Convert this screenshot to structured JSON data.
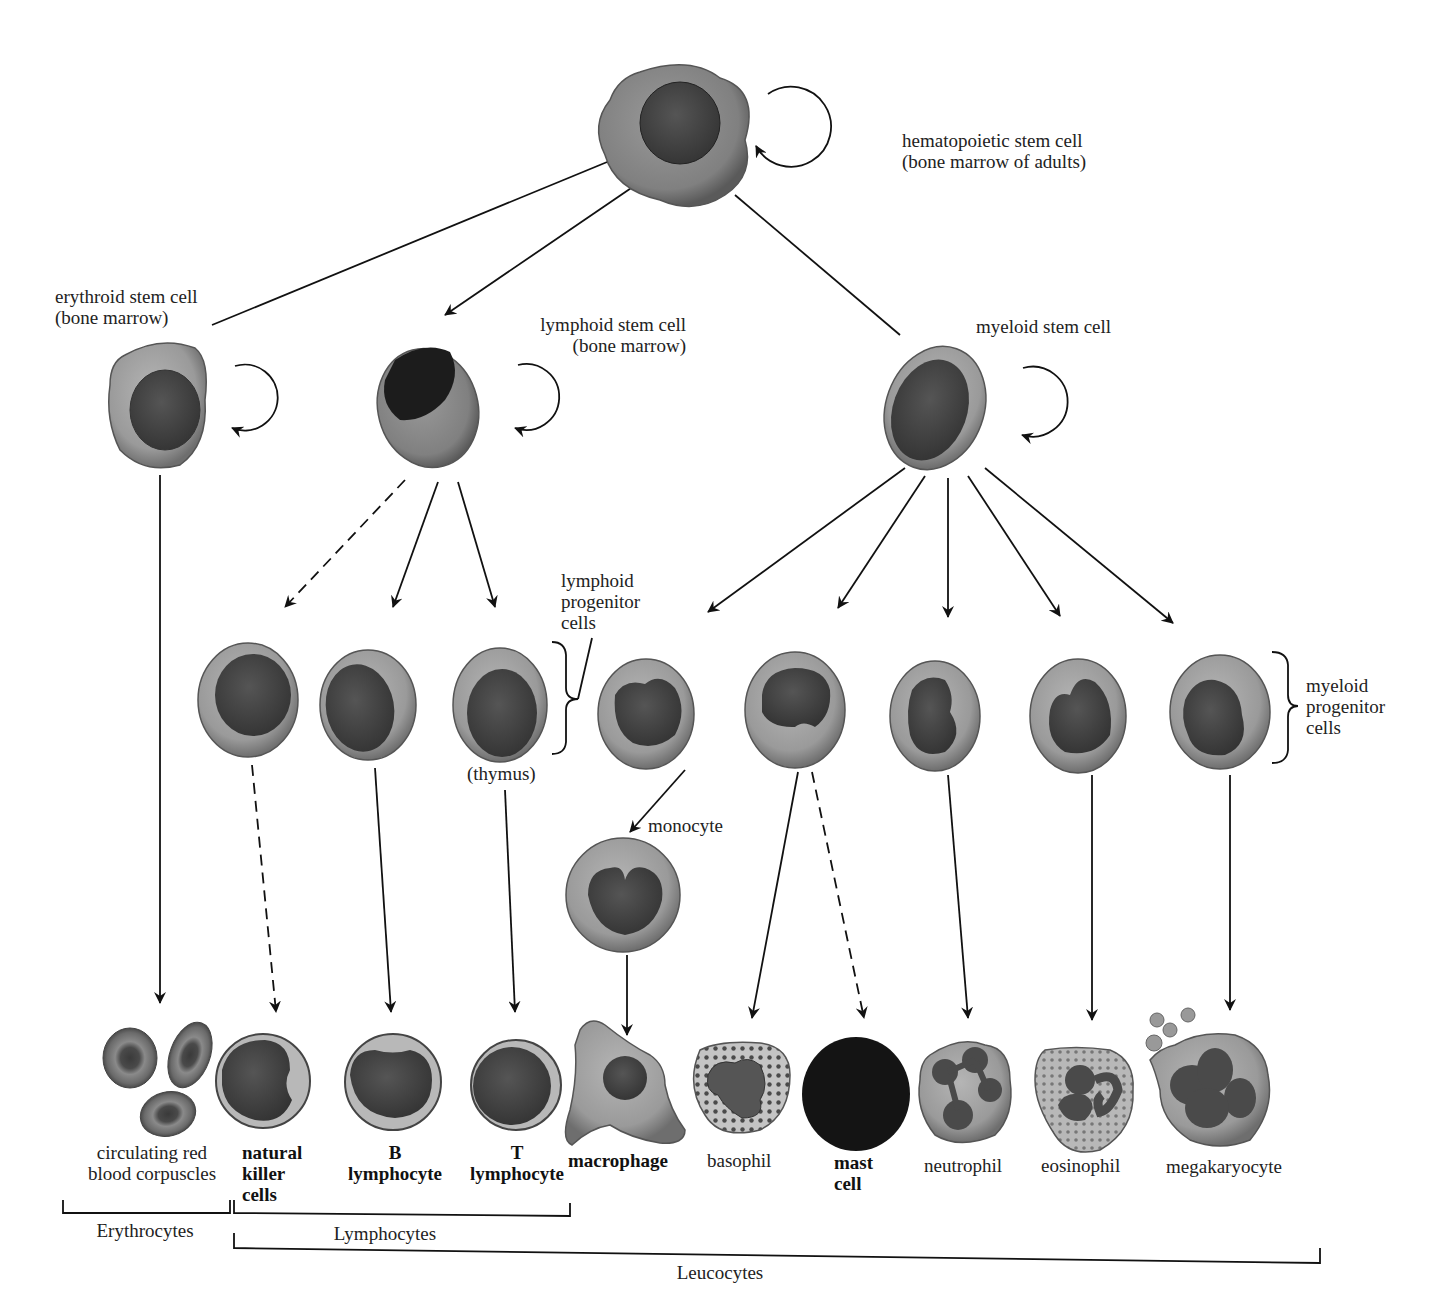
{
  "diagram": {
    "type": "hematopoiesis lineage tree",
    "colors": {
      "cytoplasm": "#8e8e8e",
      "cytoplasm_light": "#b9b9b9",
      "nucleus": "#3e3e3e",
      "nucleus_dark": "#1e1e1e",
      "line": "#111111"
    },
    "stem_cells": {
      "hematopoietic": {
        "line1": "hematopoietic stem cell",
        "line2": "(bone marrow of adults)"
      },
      "erythroid": {
        "line1": "erythroid stem cell",
        "line2": "(bone marrow)"
      },
      "lymphoid": {
        "line1": "lymphoid stem cell",
        "line2": "(bone marrow)"
      },
      "myeloid": {
        "line1": "myeloid stem cell"
      }
    },
    "progenitor_labels": {
      "lymphoid": {
        "line1": "lymphoid",
        "line2": "progenitor",
        "line3": "cells"
      },
      "thymus": "(thymus)",
      "monocyte": "monocyte",
      "myeloid": {
        "line1": "myeloid",
        "line2": "progenitor",
        "line3": "cells"
      }
    },
    "mature_cells": {
      "rbc": {
        "line1": "circulating red",
        "line2": "blood corpuscles"
      },
      "nk": {
        "line1": "natural",
        "line2": "killer",
        "line3": "cells"
      },
      "b": {
        "line1": "B",
        "line2": "lymphocyte"
      },
      "t": {
        "line1": "T",
        "line2": "lymphocyte"
      },
      "macrophage": "macrophage",
      "basophil": "basophil",
      "mast": {
        "line1": "mast",
        "line2": "cell"
      },
      "neutrophil": "neutrophil",
      "eosinophil": "eosinophil",
      "megakaryocyte": "megakaryocyte"
    },
    "categories": {
      "erythrocytes": "Erythrocytes",
      "lymphocytes": "Lymphocytes",
      "leucocytes": "Leucocytes"
    },
    "edges": [
      {
        "from": "hematopoietic stem cell",
        "to": "erythroid stem cell",
        "style": "solid"
      },
      {
        "from": "hematopoietic stem cell",
        "to": "lymphoid stem cell",
        "style": "solid"
      },
      {
        "from": "hematopoietic stem cell",
        "to": "myeloid stem cell",
        "style": "solid"
      },
      {
        "from": "erythroid stem cell",
        "to": "circulating red blood corpuscles",
        "style": "solid"
      },
      {
        "from": "lymphoid stem cell",
        "to": "NK progenitor",
        "style": "dashed"
      },
      {
        "from": "lymphoid stem cell",
        "to": "B progenitor",
        "style": "solid"
      },
      {
        "from": "lymphoid stem cell",
        "to": "T progenitor",
        "style": "solid"
      },
      {
        "from": "NK progenitor",
        "to": "natural killer cells",
        "style": "dashed"
      },
      {
        "from": "B progenitor",
        "to": "B lymphocyte",
        "style": "solid"
      },
      {
        "from": "T progenitor",
        "to": "T lymphocyte",
        "style": "solid"
      },
      {
        "from": "myeloid stem cell",
        "to": "monocyte progenitor",
        "style": "solid"
      },
      {
        "from": "myeloid stem cell",
        "to": "basophil progenitor",
        "style": "solid"
      },
      {
        "from": "myeloid stem cell",
        "to": "neutrophil progenitor",
        "style": "solid"
      },
      {
        "from": "myeloid stem cell",
        "to": "eosinophil progenitor",
        "style": "solid"
      },
      {
        "from": "myeloid stem cell",
        "to": "megakaryocyte progenitor",
        "style": "solid"
      },
      {
        "from": "monocyte progenitor",
        "to": "monocyte",
        "style": "solid"
      },
      {
        "from": "monocyte",
        "to": "macrophage",
        "style": "solid"
      },
      {
        "from": "basophil progenitor",
        "to": "basophil",
        "style": "solid"
      },
      {
        "from": "basophil progenitor",
        "to": "mast cell",
        "style": "dashed"
      },
      {
        "from": "neutrophil progenitor",
        "to": "neutrophil",
        "style": "solid"
      },
      {
        "from": "eosinophil progenitor",
        "to": "eosinophil",
        "style": "solid"
      },
      {
        "from": "megakaryocyte progenitor",
        "to": "megakaryocyte",
        "style": "solid"
      }
    ],
    "self_renewal": [
      "hematopoietic stem cell",
      "erythroid stem cell",
      "lymphoid stem cell",
      "myeloid stem cell"
    ]
  }
}
